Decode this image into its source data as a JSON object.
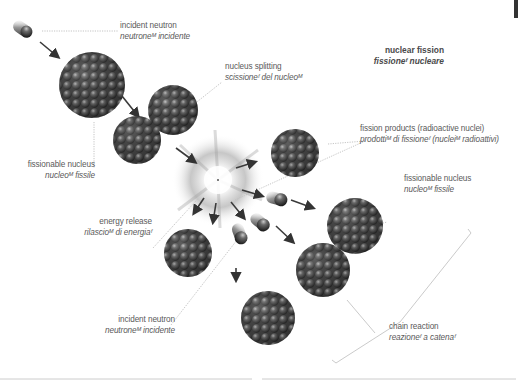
{
  "title": {
    "en": "nuclear fission",
    "it": "fissioneᶠ nucleare"
  },
  "labels": {
    "incident_neutron_top": {
      "en": "incident neutron",
      "it": "neutroneᴹ incidente"
    },
    "nucleus_splitting": {
      "en": "nucleus splitting",
      "it": "scissioneᶠ del nucleoᴹ"
    },
    "fissionable_nucleus_left": {
      "en": "fissionable nucleus",
      "it": "nucleoᴹ fissile"
    },
    "fission_products": {
      "en": "fission products (radioactive nuclei)",
      "it": "prodottiᴹ di fissioneᶠ (nucleiᴹ radioattivi)"
    },
    "fissionable_nucleus_right": {
      "en": "fissionable nucleus",
      "it": "nucleoᴹ fissile"
    },
    "energy_release": {
      "en": "energy release",
      "it": "rilascioᴹ di energiaᶠ"
    },
    "incident_neutron_bottom": {
      "en": "incident neutron",
      "it": "neutroneᴹ incidente"
    },
    "chain_reaction": {
      "en": "chain reaction",
      "it": "reazioneᶠ a catenaᶠ"
    }
  },
  "colors": {
    "nucleus": "#4a4a4a",
    "nucleus_highlight": "#9a9a9a",
    "leader_line": "#b0b0b0",
    "arrow": "#3a3a3a",
    "text": "#5a5a5a"
  },
  "icons": {
    "neutron": "neutron-sphere",
    "nucleus": "nucleus-cluster",
    "burst": "energy-burst"
  }
}
